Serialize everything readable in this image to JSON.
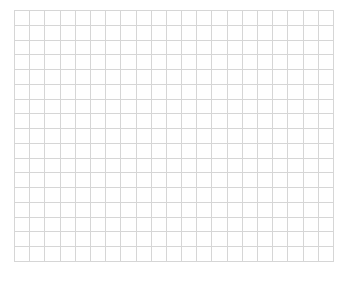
{
  "grid": {
    "columns": 21,
    "rows": 17,
    "width": 319,
    "height": 251,
    "line_color": "#d6d6d6",
    "background": "#ffffff"
  }
}
